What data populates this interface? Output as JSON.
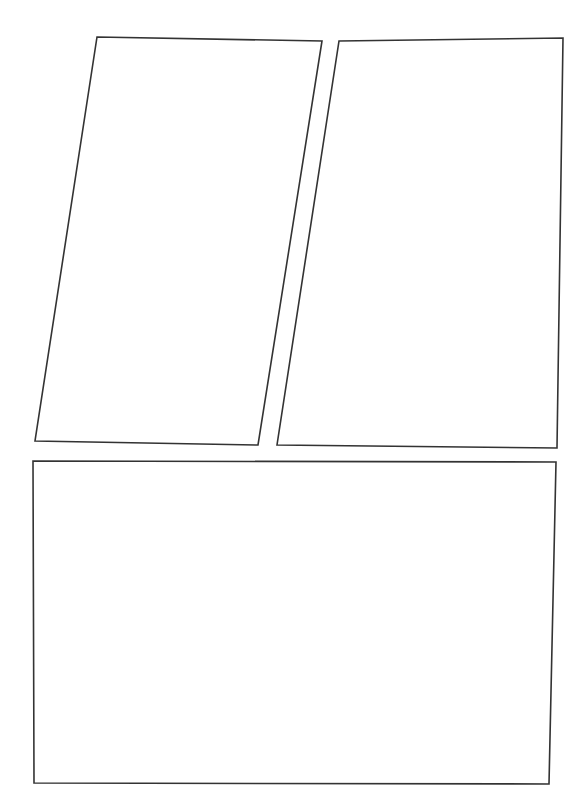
{
  "page": {
    "background_color": "#ffffff",
    "width": 584,
    "height": 805
  },
  "style": {
    "stroke_color": "#333333",
    "stroke_width": 1.6,
    "fill_color": "#ffffff"
  },
  "panels": [
    {
      "id": "panel-1",
      "label": "Panel 1",
      "shape": "quadrilateral",
      "position": "top-left",
      "content": "",
      "points": "97,37 322,41 258,445 35,441"
    },
    {
      "id": "panel-2",
      "label": "Panel 2",
      "shape": "quadrilateral",
      "position": "top-right",
      "content": "",
      "points": "339,41 563,38 557,448 277,445"
    },
    {
      "id": "panel-3",
      "label": "Panel 3",
      "shape": "rectangle",
      "position": "bottom",
      "content": "",
      "points": "33,461 556,462 549,784 34,783"
    }
  ]
}
